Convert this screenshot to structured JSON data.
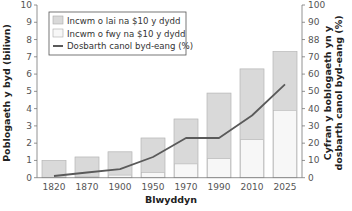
{
  "chart_data": {
    "type": "bar",
    "subtype": "overlapping bars with line on secondary axis",
    "title": "",
    "xlabel": "Blwyddyn",
    "ylabel": "Poblogaeth y byd (biliwn)",
    "ylabel_right_line1": "Cyfran y boblogaeth yn y",
    "ylabel_right_line2": "dosbarth canol byd-eang (%)",
    "categories": [
      "1820",
      "1870",
      "1900",
      "1950",
      "1970",
      "1990",
      "2010",
      "2025"
    ],
    "series": [
      {
        "name": "Incwm o lai na $10 y dydd",
        "type": "bar",
        "axis": "left",
        "note": "total bar height = world population",
        "values": [
          1.0,
          1.2,
          1.5,
          2.3,
          3.4,
          4.9,
          6.3,
          7.3
        ],
        "color": "#d9d9d9"
      },
      {
        "name": "Incwm o fwy na $10 y dydd",
        "type": "bar",
        "axis": "left",
        "values": [
          0.0,
          0.05,
          0.15,
          0.3,
          0.8,
          1.1,
          2.2,
          3.9
        ],
        "color": "#f7f7f7"
      },
      {
        "name": "Dosbarth canol byd-eang (%)",
        "type": "line",
        "axis": "right",
        "values": [
          1,
          3,
          5,
          12,
          23,
          23,
          36,
          54
        ],
        "color": "#5a5a5a"
      }
    ],
    "ylim": [
      0,
      10
    ],
    "ylim_right": [
      0,
      100
    ],
    "yticks": [
      "0",
      "1",
      "2",
      "3",
      "4",
      "5",
      "6",
      "7",
      "8",
      "9",
      "10"
    ],
    "yticks_right": [
      "0",
      "10",
      "20",
      "30",
      "40",
      "50",
      "60",
      "70",
      "88",
      "90",
      "100"
    ],
    "grid": false,
    "legend_position": "upper left"
  },
  "legend": [
    {
      "label": "Incwm o lai na $10 y dydd",
      "kind": "box",
      "color": "#d9d9d9"
    },
    {
      "label": "Incwm o fwy na $10 y dydd",
      "kind": "box",
      "color": "#f7f7f7"
    },
    {
      "label": "Dosbarth canol byd-eang (%)",
      "kind": "line",
      "color": "#5a5a5a"
    }
  ]
}
